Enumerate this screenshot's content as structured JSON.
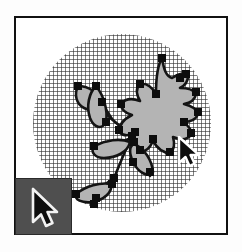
{
  "app": {
    "title": "Vector Drawing Canvas",
    "type": "illustration-editor-canvas"
  },
  "canvas": {
    "name": "drawing-canvas",
    "background_color": "#ffffff",
    "border_color": "#111111"
  },
  "backdrop": {
    "name": "grid-circle",
    "shape": "circle",
    "fill": "grid-crosshatch-pattern",
    "pattern_color": "#282828",
    "diameter_px": 178
  },
  "artwork": {
    "name": "plant-illustration",
    "description": "stylized plant with leaves, stems and a large lobed leaf",
    "fill_color": "#b4b4b4",
    "stroke_color": "#141414"
  },
  "selection": {
    "name": "path-selection",
    "handle_color": "#0d0d0d",
    "handle_size_px": 7,
    "handle_shape": "square",
    "selected_object": "large-lobed-leaf"
  },
  "tool_palette": {
    "name": "tool-palette",
    "background_color": "#4f4f4f",
    "active_tool": "selection-arrow",
    "active_tool_icon": "arrow-cursor-icon"
  },
  "cursor": {
    "name": "pointer-cursor",
    "icon": "arrow-cursor-icon",
    "fill": "#0d0d0d",
    "outline": "#ffffff"
  }
}
